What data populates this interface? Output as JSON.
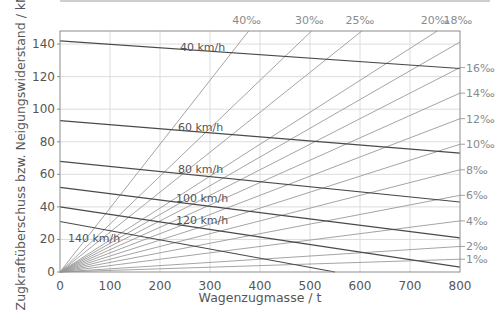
{
  "chart_data": {
    "type": "line",
    "title": "",
    "xlabel": "Wagenzugmasse / t",
    "ylabel": "Zugkraftüberschuss bzw. Neigungswiderstand / kN",
    "xlim": [
      0,
      800
    ],
    "ylim": [
      0,
      148
    ],
    "x_ticks": [
      0,
      100,
      200,
      300,
      400,
      500,
      600,
      700,
      800
    ],
    "y_ticks": [
      0,
      20,
      40,
      60,
      80,
      100,
      120,
      140
    ],
    "grid": true,
    "speed_series": [
      {
        "name": "40 km/h",
        "label": "40 km/h",
        "x": [
          0,
          800
        ],
        "y": [
          142,
          125
        ]
      },
      {
        "name": "60 km/h",
        "label": "60 km/h",
        "x": [
          0,
          800
        ],
        "y": [
          93,
          73
        ]
      },
      {
        "name": "80 km/h",
        "label": "80 km/h",
        "x": [
          0,
          800
        ],
        "y": [
          68,
          43
        ]
      },
      {
        "name": "100 km/h",
        "label": "100 km/h",
        "x": [
          0,
          800
        ],
        "y": [
          52,
          21
        ]
      },
      {
        "name": "120 km/h",
        "label": "120 km/h",
        "x": [
          0,
          800
        ],
        "y": [
          40,
          3
        ]
      },
      {
        "name": "140 km/h",
        "label": "140 km/h",
        "x": [
          0,
          550
        ],
        "y": [
          31,
          0
        ]
      }
    ],
    "gradient_series": [
      {
        "name": "1‰",
        "label": "1‰",
        "kN_per_t": 0.00981,
        "label_position": "right"
      },
      {
        "name": "2‰",
        "label": "2‰",
        "kN_per_t": 0.01962,
        "label_position": "right"
      },
      {
        "name": "4‰",
        "label": "4‰",
        "kN_per_t": 0.03924,
        "label_position": "right"
      },
      {
        "name": "6‰",
        "label": "6‰",
        "kN_per_t": 0.05886,
        "label_position": "right"
      },
      {
        "name": "8‰",
        "label": "8‰",
        "kN_per_t": 0.07848,
        "label_position": "right"
      },
      {
        "name": "10‰",
        "label": "10‰",
        "kN_per_t": 0.0981,
        "label_position": "right"
      },
      {
        "name": "12‰",
        "label": "12‰",
        "kN_per_t": 0.11772,
        "label_position": "right"
      },
      {
        "name": "14‰",
        "label": "14‰",
        "kN_per_t": 0.13734,
        "label_position": "right"
      },
      {
        "name": "16‰",
        "label": "16‰",
        "kN_per_t": 0.15696,
        "label_position": "right"
      },
      {
        "name": "18‰",
        "label": "18‰",
        "kN_per_t": 0.17658,
        "label_position": "top"
      },
      {
        "name": "20‰",
        "label": "20‰",
        "kN_per_t": 0.1962,
        "label_position": "top"
      },
      {
        "name": "25‰",
        "label": "25‰",
        "kN_per_t": 0.24525,
        "label_position": "top"
      },
      {
        "name": "30‰",
        "label": "30‰",
        "kN_per_t": 0.2943,
        "label_position": "top"
      },
      {
        "name": "40‰",
        "label": "40‰",
        "kN_per_t": 0.3924,
        "label_position": "top"
      }
    ],
    "colors": {
      "speed_line": "#4a4a4a",
      "gradient_line": "#9a9a9a",
      "grid": "#dcdcdc",
      "frame": "#8c8c8c"
    }
  }
}
